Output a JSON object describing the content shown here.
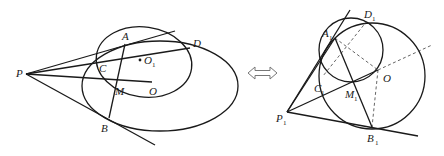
{
  "figure": {
    "left": {
      "labels": {
        "P": "P",
        "A": "A",
        "D": "D",
        "C": "C",
        "O1_main": "O",
        "O1_sub": "1",
        "M": "M",
        "O": "O",
        "B": "B"
      }
    },
    "equivalence_symbol": "⟺",
    "right": {
      "labels": {
        "P1_main": "P",
        "P1_sub": "1",
        "A1_main": "A",
        "A1_sub": "1",
        "D1_main": "D",
        "D1_sub": "1",
        "C1_main": "C",
        "C1_sub": "1",
        "M1_main": "M",
        "M1_sub": "1",
        "O": "O",
        "B1_main": "B",
        "B1_sub": "1"
      }
    }
  }
}
